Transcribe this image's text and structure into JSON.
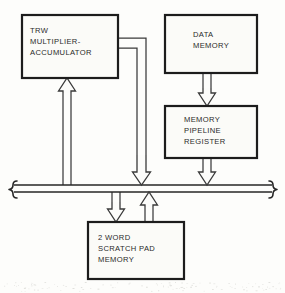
{
  "diagram": {
    "style": {
      "background_color": "#fdfdfb",
      "box_fill": "#fbfbf8",
      "box_stroke": "#1c1c1c",
      "line_color": "#3a3a3a",
      "bus_color": "#262626",
      "text_color": "#2a2a2a"
    },
    "blocks": [
      {
        "id": "trw-multiplier-accumulator",
        "name": "trw-multiplier-accumulator-block",
        "lines": [
          "TRW",
          "MULTIPLIER-",
          "ACCUMULATOR"
        ],
        "x": 22,
        "y": 15,
        "w": 96,
        "h": 63,
        "text_x": 30,
        "text_y_start": 31,
        "line_height": 11
      },
      {
        "id": "data-memory",
        "name": "data-memory-block",
        "lines": [
          "DATA",
          "MEMORY"
        ],
        "x": 165,
        "y": 15,
        "w": 92,
        "h": 58,
        "text_x": 193,
        "text_y_start": 35,
        "line_height": 11
      },
      {
        "id": "memory-pipeline-register",
        "name": "memory-pipeline-register-block",
        "lines": [
          "MEMORY",
          "PIPELINE",
          "REGISTER"
        ],
        "x": 165,
        "y": 106,
        "w": 92,
        "h": 52,
        "text_x": 184,
        "text_y_start": 120,
        "line_height": 11
      },
      {
        "id": "scratch-pad-memory",
        "name": "scratch-pad-memory-block",
        "lines": [
          "2 WORD",
          "SCRATCH PAD",
          "MEMORY"
        ],
        "x": 88,
        "y": 222,
        "w": 96,
        "h": 57,
        "text_x": 98,
        "text_y_start": 238,
        "line_height": 11
      }
    ],
    "bus": {
      "name": "system-data-bus",
      "label": "",
      "x_left": 14,
      "x_right": 272,
      "y_top": 185,
      "y_bottom": 192
    },
    "connections": [
      {
        "id": "trw-out-upper",
        "name": "trw-to-bus-path-outer",
        "description": "TRW right edge to vertical drop, outer route",
        "path": "M118,38 L146,38 L146,155"
      },
      {
        "id": "trw-out-lower",
        "name": "trw-to-bus-path-inner",
        "description": "TRW right edge to vertical drop, inner route",
        "path": "M118,48 L137,48 L137,155"
      },
      {
        "id": "bus-to-trw-shaft-left",
        "name": "bus-to-trw-shaft-left",
        "description": "left rail of upward feedback shaft",
        "path": "M63,185 L63,93"
      },
      {
        "id": "bus-to-trw-shaft-right",
        "name": "bus-to-trw-shaft-right",
        "description": "right rail of upward feedback shaft",
        "path": "M71,185 L71,93"
      },
      {
        "id": "data-memory-to-pipeline-left",
        "name": "data-memory-to-pipeline-shaft-left",
        "path": "M203,73 L203,88"
      },
      {
        "id": "data-memory-to-pipeline-right",
        "name": "data-memory-to-pipeline-shaft-right",
        "path": "M211,73 L211,88"
      },
      {
        "id": "pipeline-to-bus-left",
        "name": "pipeline-to-bus-shaft-left",
        "path": "M203,158 L203,170"
      },
      {
        "id": "pipeline-to-bus-right",
        "name": "pipeline-to-bus-shaft-right",
        "path": "M211,158 L211,170"
      },
      {
        "id": "bus-to-scratch-left",
        "name": "bus-to-scratchpad-shaft-left",
        "path": "M112,192 L112,202"
      },
      {
        "id": "bus-to-scratch-right",
        "name": "bus-to-scratchpad-shaft-right",
        "path": "M120,192 L120,202"
      },
      {
        "id": "scratch-to-bus-left",
        "name": "scratchpad-to-bus-shaft-left",
        "path": "M145,222 L145,207"
      },
      {
        "id": "scratch-to-bus-right",
        "name": "scratchpad-to-bus-shaft-right",
        "path": "M153,222 L153,207"
      }
    ],
    "arrows": [
      {
        "id": "arrow-trw-to-bus",
        "name": "arrow-trw-to-bus",
        "direction": "down",
        "tip_x": 141.5,
        "tip_y": 185,
        "shaft_half_width": 4.5,
        "head_half_width": 9,
        "head_length": 13,
        "shaft_top": 155
      },
      {
        "id": "arrow-bus-to-trw",
        "name": "arrow-bus-to-trw",
        "direction": "up",
        "tip_x": 67,
        "tip_y": 78,
        "shaft_half_width": 4,
        "head_half_width": 8.5,
        "head_length": 13,
        "shaft_top": 93
      },
      {
        "id": "arrow-data-memory-to-pipeline",
        "name": "arrow-data-memory-to-pipeline",
        "direction": "down",
        "tip_x": 207,
        "tip_y": 106,
        "shaft_half_width": 4,
        "head_half_width": 8.5,
        "head_length": 13,
        "shaft_top": 88
      },
      {
        "id": "arrow-pipeline-to-bus",
        "name": "arrow-pipeline-to-bus",
        "direction": "down",
        "tip_x": 207,
        "tip_y": 185,
        "shaft_half_width": 4,
        "head_half_width": 8.5,
        "head_length": 13,
        "shaft_top": 170
      },
      {
        "id": "arrow-bus-to-scratchpad",
        "name": "arrow-bus-to-scratchpad",
        "direction": "down",
        "tip_x": 116,
        "tip_y": 222,
        "shaft_half_width": 4,
        "head_half_width": 8.5,
        "head_length": 13,
        "shaft_top": 202
      },
      {
        "id": "arrow-scratchpad-to-bus",
        "name": "arrow-scratchpad-to-bus",
        "direction": "up",
        "tip_x": 149,
        "tip_y": 192,
        "shaft_half_width": 4,
        "head_half_width": 8.5,
        "head_length": 13,
        "shaft_top": 207
      }
    ]
  }
}
